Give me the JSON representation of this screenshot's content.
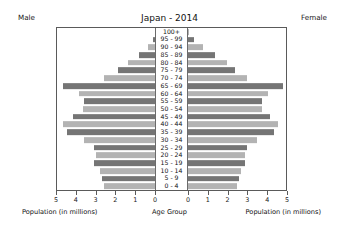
{
  "header": {
    "male_label": "Male",
    "female_label": "Female",
    "title": "Japan - 2014"
  },
  "captions": {
    "left": "Population (in millions)",
    "center": "Age Group",
    "right": "Population (in millions)"
  },
  "axis": {
    "left_ticks": [
      "5",
      "4",
      "3",
      "2",
      "1",
      "0"
    ],
    "right_ticks": [
      "0",
      "1",
      "2",
      "3",
      "4",
      "5"
    ]
  },
  "colors": {
    "bar_light": "#b3b3b3",
    "bar_dark": "#757575",
    "frame": "#5a5a5a",
    "text": "#111111",
    "background": "#ffffff"
  },
  "chart_data": {
    "type": "bar",
    "subtype": "population-pyramid",
    "title": "Japan - 2014",
    "xlabel": "Population (in millions)",
    "ylabel": "Age Group",
    "xlim": [
      0,
      5
    ],
    "grid": false,
    "legend": [
      "Male",
      "Female"
    ],
    "legend_position": "top-corners",
    "categories": [
      "100+",
      "95 - 99",
      "90 - 94",
      "85 - 89",
      "80 - 84",
      "75 - 79",
      "70 - 74",
      "65 - 69",
      "60 - 64",
      "55 - 59",
      "50 - 54",
      "45 - 49",
      "40 - 44",
      "35 - 39",
      "30 - 34",
      "25 - 29",
      "20 - 24",
      "15 - 19",
      "10 - 14",
      "5 - 9",
      "0 - 4"
    ],
    "series": [
      {
        "name": "Male",
        "side": "left",
        "values": [
          0.01,
          0.1,
          0.35,
          0.8,
          1.4,
          1.9,
          2.6,
          4.7,
          3.9,
          3.6,
          3.7,
          4.2,
          4.7,
          4.5,
          3.6,
          3.1,
          3.0,
          3.1,
          2.8,
          2.7,
          2.6
        ]
      },
      {
        "name": "Female",
        "side": "right",
        "values": [
          0.06,
          0.3,
          0.75,
          1.4,
          2.0,
          2.4,
          3.0,
          4.85,
          4.1,
          3.8,
          3.8,
          4.2,
          4.6,
          4.4,
          3.5,
          3.0,
          2.9,
          2.9,
          2.7,
          2.6,
          2.5
        ]
      }
    ]
  }
}
